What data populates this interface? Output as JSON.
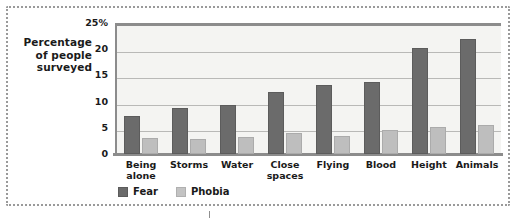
{
  "chart_data": {
    "type": "bar",
    "title": "",
    "xlabel": "",
    "ylabel": "Percentage of people surveyed",
    "ylim": [
      0,
      25
    ],
    "yticks": [
      "0",
      "5",
      "10",
      "15",
      "20",
      "25%"
    ],
    "ytick_values": [
      0,
      5,
      10,
      15,
      20,
      25
    ],
    "grid": true,
    "legend_position": "bottom-left",
    "categories": [
      "Being\nalone",
      "Storms",
      "Water",
      "Close\nspaces",
      "Flying",
      "Blood",
      "Height",
      "Animals"
    ],
    "series": [
      {
        "name": "Fear",
        "color": "#6b6b6b",
        "values": [
          7.3,
          8.7,
          9.3,
          11.8,
          13.1,
          13.8,
          20.2,
          22.0
        ]
      },
      {
        "name": "Phobia",
        "color": "#bebebe",
        "values": [
          3.1,
          2.9,
          3.3,
          4.1,
          3.5,
          4.5,
          5.2,
          5.5
        ]
      }
    ]
  },
  "axis_title": {
    "line1": "Percentage",
    "line2": "of people",
    "line3": "surveyed"
  },
  "colors": {
    "fear": "#6b6b6b",
    "phobia": "#bebebe",
    "plot_background": "#f4f4f2",
    "gridline": "#b9b9b7",
    "axis": "#8c8c8c",
    "frame": "#9a9a9a",
    "text": "#1a1a1a"
  }
}
